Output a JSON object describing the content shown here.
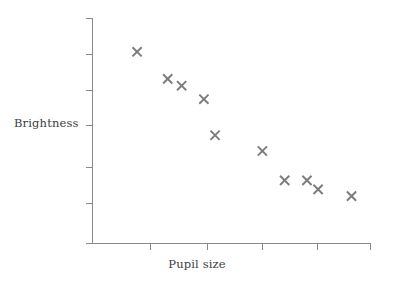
{
  "chart_data": {
    "type": "scatter",
    "title": "",
    "xlabel": "Pupil size",
    "ylabel": "Brightness",
    "legend": [],
    "grid": false,
    "x_tick_labels": [],
    "y_tick_labels": [],
    "xlim": [
      0,
      10
    ],
    "ylim": [
      0,
      10
    ],
    "series": [
      {
        "name": "observations",
        "marker": "x",
        "color": "#7b7b7b",
        "points": [
          {
            "x": 1.6,
            "y": 8.5
          },
          {
            "x": 2.7,
            "y": 7.3
          },
          {
            "x": 3.2,
            "y": 7.0
          },
          {
            "x": 4.0,
            "y": 6.4
          },
          {
            "x": 4.4,
            "y": 4.8
          },
          {
            "x": 6.1,
            "y": 4.1
          },
          {
            "x": 6.9,
            "y": 2.8
          },
          {
            "x": 7.7,
            "y": 2.8
          },
          {
            "x": 8.1,
            "y": 2.4
          },
          {
            "x": 9.3,
            "y": 2.1
          }
        ]
      }
    ],
    "axes": {
      "y_tick_count": 6,
      "x_tick_count": 5,
      "axis_color": "#8a8a8a"
    }
  },
  "labels": {
    "y_axis": "Brightness",
    "x_axis": "Pupil size"
  },
  "colors": {
    "marker": "#7b7b7b",
    "axis": "#8a8a8a",
    "text": "#3d3d3d",
    "background": "#ffffff"
  }
}
